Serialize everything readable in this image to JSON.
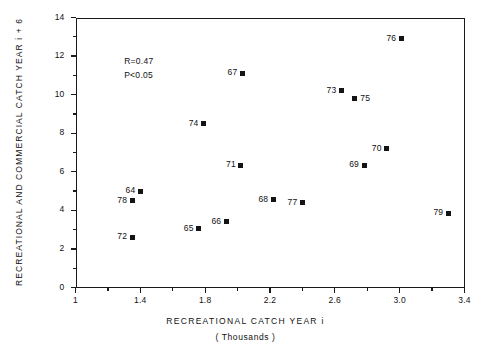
{
  "chart_data": {
    "type": "scatter",
    "title": "",
    "xlabel": "RECREATIONAL  CATCH  YEAR i",
    "xsublabel": "( Thousands )",
    "ylabel": "RECREATIONAL  AND  COMMERCIAL  CATCH   YEAR i + 6",
    "xlim": [
      1,
      3.4
    ],
    "ylim": [
      0,
      14
    ],
    "xticks": [
      1,
      1.4,
      1.8,
      2.2,
      2.6,
      3.0,
      3.4
    ],
    "xticklabels": [
      "1",
      "1.4",
      "1.8",
      "2.2",
      "2.6",
      "3.0",
      "3.4"
    ],
    "xminorticks": [
      1.2,
      1.6,
      2.0,
      2.4,
      2.8,
      3.2
    ],
    "yticks": [
      0,
      2,
      4,
      6,
      8,
      10,
      12,
      14
    ],
    "yticklabels": [
      "0",
      "2",
      "4",
      "6",
      "8",
      "10",
      "12",
      "14"
    ],
    "yminorticks": [
      1,
      3,
      5,
      7,
      9,
      11,
      13
    ],
    "grid": false,
    "legend": false,
    "marker": "square",
    "marker_color": "#141414",
    "annotations": [
      "R=0.47",
      "P<0.05"
    ],
    "points": [
      {
        "label": "76",
        "x": 3.01,
        "y": 12.9,
        "label_side": "left"
      },
      {
        "label": "67",
        "x": 2.03,
        "y": 11.1,
        "label_side": "left"
      },
      {
        "label": "73",
        "x": 2.64,
        "y": 10.2,
        "label_side": "left"
      },
      {
        "label": "75",
        "x": 2.72,
        "y": 9.8,
        "label_side": "right"
      },
      {
        "label": "74",
        "x": 1.79,
        "y": 8.5,
        "label_side": "left"
      },
      {
        "label": "70",
        "x": 2.92,
        "y": 7.2,
        "label_side": "left"
      },
      {
        "label": "71",
        "x": 2.02,
        "y": 6.35,
        "label_side": "left"
      },
      {
        "label": "69",
        "x": 2.78,
        "y": 6.35,
        "label_side": "left"
      },
      {
        "label": "64",
        "x": 1.4,
        "y": 5.0,
        "label_side": "left"
      },
      {
        "label": "68",
        "x": 2.22,
        "y": 4.55,
        "label_side": "left"
      },
      {
        "label": "78",
        "x": 1.35,
        "y": 4.5,
        "label_side": "left"
      },
      {
        "label": "77",
        "x": 2.4,
        "y": 4.4,
        "label_side": "left"
      },
      {
        "label": "79",
        "x": 3.3,
        "y": 3.85,
        "label_side": "left"
      },
      {
        "label": "66",
        "x": 1.93,
        "y": 3.4,
        "label_side": "left"
      },
      {
        "label": "65",
        "x": 1.76,
        "y": 3.05,
        "label_side": "left"
      },
      {
        "label": "72",
        "x": 1.35,
        "y": 2.6,
        "label_side": "left"
      }
    ]
  },
  "stats": {
    "r": "R=0.47",
    "p": "P<0.05"
  }
}
